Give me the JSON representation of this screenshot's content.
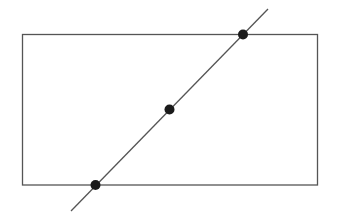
{
  "diagram": {
    "width": 337,
    "height": 224,
    "colors": {
      "background": "#ffffff",
      "stroke": "#555555",
      "point": "#1a1a1a"
    },
    "rectangle": {
      "x": 22.5,
      "y": 34.5,
      "width": 295,
      "height": 150.5
    },
    "line": {
      "x1": 71,
      "y1": 211,
      "x2": 268,
      "y2": 9
    },
    "points": [
      {
        "name": "bottom-intersection",
        "cx": 95.5,
        "cy": 185,
        "r": 5
      },
      {
        "name": "midpoint",
        "cx": 169.5,
        "cy": 109.5,
        "r": 5
      },
      {
        "name": "top-intersection",
        "cx": 243,
        "cy": 34.5,
        "r": 5
      }
    ]
  }
}
